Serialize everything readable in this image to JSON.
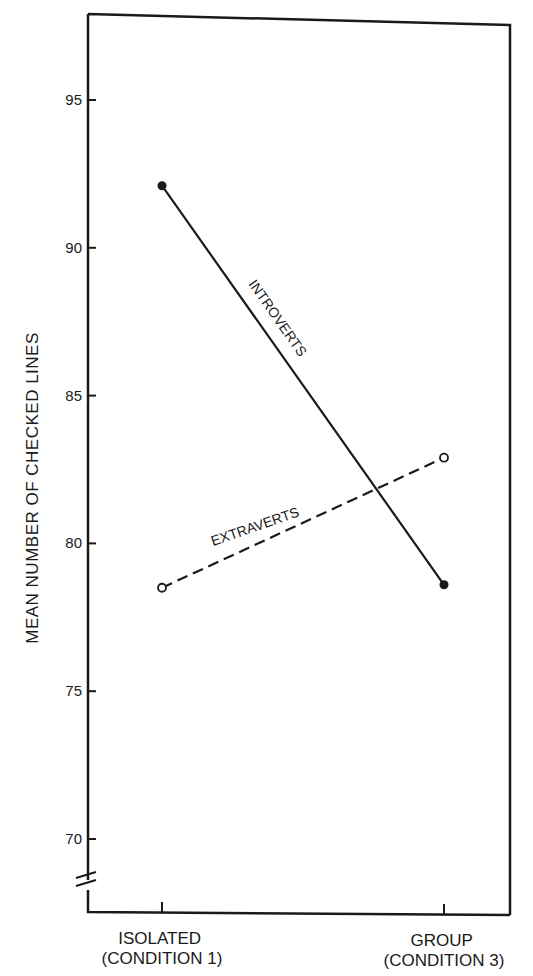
{
  "chart_data": {
    "type": "line",
    "title": "",
    "xlabel": "",
    "ylabel": "MEAN NUMBER OF CHECKED LINES",
    "categories": [
      "ISOLATED (CONDITION 1)",
      "GROUP (CONDITION 3)"
    ],
    "category_lines": [
      [
        "ISOLATED",
        "(CONDITION 1)"
      ],
      [
        "GROUP",
        "(CONDITION 3)"
      ]
    ],
    "yticks": [
      70,
      75,
      80,
      85,
      90,
      95
    ],
    "ylim": [
      67,
      98
    ],
    "axis_break": true,
    "grid": false,
    "legend": "inline labels on lines",
    "series": [
      {
        "name": "INTROVERTS",
        "values": [
          92.1,
          78.6
        ],
        "style": "solid",
        "marker": "filled-circle"
      },
      {
        "name": "EXTRAVERTS",
        "values": [
          78.5,
          82.9
        ],
        "style": "dashed",
        "marker": "open-circle"
      }
    ]
  },
  "colors": {
    "ink": "#1a1a1a",
    "background": "#ffffff"
  }
}
